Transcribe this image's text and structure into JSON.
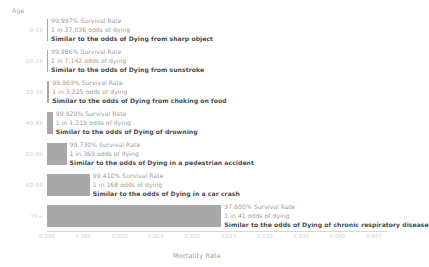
{
  "chart_data": {
    "type": "bar",
    "orientation": "horizontal",
    "title": "",
    "xlabel": "Mortality Rate",
    "ylabel": "Age",
    "xlim": [
      0.0,
      0.0468
    ],
    "grid": false,
    "legend": "none",
    "xticks": [
      "0.000",
      "0.005",
      "0.010",
      "0.015",
      "0.020",
      "0.025",
      "0.030",
      "0.035",
      "0.040",
      "0.045"
    ],
    "xtick_values": [
      0.0,
      0.005,
      0.01,
      0.015,
      0.02,
      0.025,
      0.03,
      0.035,
      0.04,
      0.045
    ],
    "categories": [
      "0-19",
      "20-29",
      "30-39",
      "40-49",
      "50-59",
      "60-69",
      "70+"
    ],
    "values": [
      2.7e-05,
      0.00014,
      0.00031,
      0.0008,
      0.0027,
      0.0059,
      0.024
    ],
    "bar_color": "#a8a8a8",
    "annotations": [
      {
        "survival": "99.997% Survival Rate",
        "odds": "1 in 37,036 odds of dying",
        "similar": "Similar to the odds of Dying from sharp object"
      },
      {
        "survival": "99.986% Survival Rate",
        "odds": "1 in 7,142 odds of dying",
        "similar": "Similar to the odds of Dying from sunstroke"
      },
      {
        "survival": "99.969% Survival Rate",
        "odds": "1 in 3,225 odds of dying",
        "similar": "Similar to the odds of Dying from choking on food"
      },
      {
        "survival": "99.920% Survival Rate",
        "odds": "1 in 1,219 odds of dying",
        "similar": "Similar to the odds of Dying of drowning"
      },
      {
        "survival": "99.730% Survival Rate",
        "odds": "1 in 369 odds of dying",
        "similar": "Similar to the odds of Dying in a pedestrian accident"
      },
      {
        "survival": "99.410% Survival Rate",
        "odds": "1 in 168 odds of dying",
        "similar": "Similar to the odds of Dying in a car crash"
      },
      {
        "survival": "97.600% Survival Rate",
        "odds": "1 in 41 odds of dying",
        "similar": "Similar to the odds of Dying of chronic respiratory disease"
      }
    ]
  }
}
